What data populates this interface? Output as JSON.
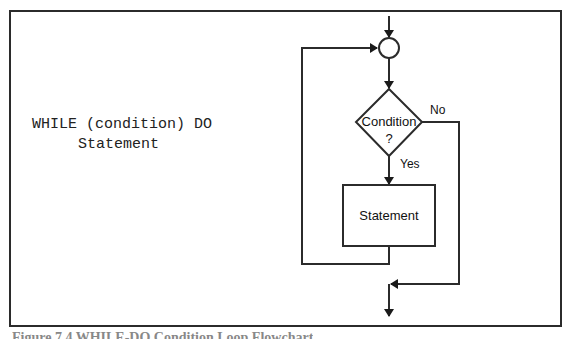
{
  "code": {
    "line1": "WHILE (condition) DO",
    "line2": "Statement"
  },
  "flowchart": {
    "decision_label_line1": "Condition",
    "decision_label_line2": "?",
    "yes_label": "Yes",
    "no_label": "No",
    "process_label": "Statement"
  },
  "caption": "Figure 7.4 WHILE-DO Condition Loop Flowchart",
  "colors": {
    "stroke": "#2b2b2b",
    "background": "#ffffff"
  }
}
